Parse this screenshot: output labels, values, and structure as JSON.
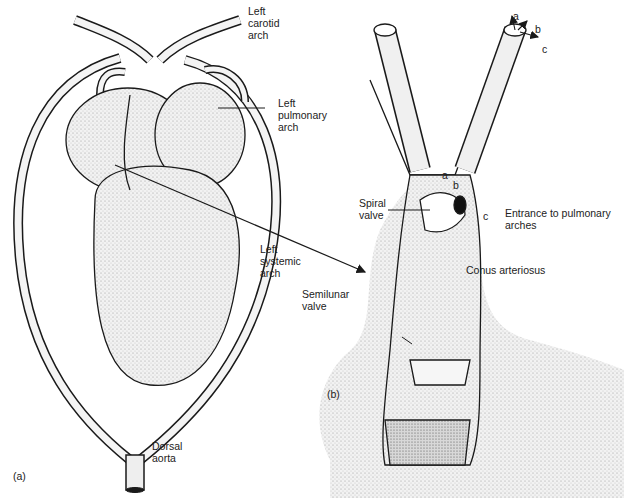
{
  "figure": {
    "panel_a": {
      "tag": "(a)",
      "labels": {
        "left_carotid_arch": "Left\ncarotid\narch",
        "left_pulmonary_arch": "Left\npulmonary\narch",
        "left_systemic_arch": "Left\nsystemic\narch",
        "dorsal_aorta": "Dorsal\naorta"
      }
    },
    "panel_b": {
      "tag": "(b)",
      "labels": {
        "spiral_valve": "Spiral\nvalve",
        "entrance_to_pulmonary_arches": "Entrance to pulmonary\narches",
        "conus_arteriosus": "Conus arteriosus",
        "semilunar_valve": "Semilunar\nvalve"
      },
      "flow_letters": [
        "a",
        "b",
        "c"
      ],
      "inner_letters": [
        "a",
        "b",
        "c"
      ]
    }
  },
  "colors": {
    "ink": "#1a1a1a",
    "stipple": "#bdbdbd",
    "background": "#ffffff"
  }
}
